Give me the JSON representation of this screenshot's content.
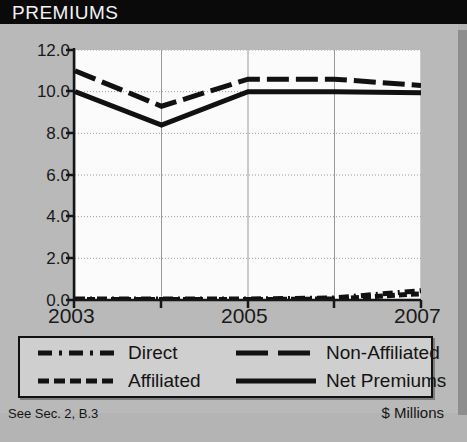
{
  "header": {
    "title": "PREMIUMS"
  },
  "footer": {
    "note": "See Sec. 2, B.3",
    "units": "$ Millions",
    "banner": "DIRECT PREMIUMS WRITTEN - YE 2007"
  },
  "colors": {
    "title_bar_bg": "#0a0a0a",
    "title_text": "#f2f2f2",
    "panel_bg": "#b9b9b9",
    "plot_bg": "#fbfbfb",
    "line": "#111111",
    "grid": "#9a9a9a",
    "legend_bg": "#cfcfcf"
  },
  "chart_data": {
    "type": "line",
    "title": "PREMIUMS",
    "xlabel": "",
    "ylabel": "$ Millions",
    "x": [
      2003,
      2004,
      2005,
      2006,
      2007
    ],
    "xticks": [
      "2003",
      "2005",
      "2007"
    ],
    "xtick_values": [
      2003,
      2005,
      2007
    ],
    "yticks": [
      "0.0",
      "2.0",
      "4.0",
      "6.0",
      "8.0",
      "10.0",
      "12.0"
    ],
    "ytick_values": [
      0.0,
      2.0,
      4.0,
      6.0,
      8.0,
      10.0,
      12.0
    ],
    "ylim": [
      0.0,
      12.0
    ],
    "xlim": [
      2003,
      2007
    ],
    "grid": true,
    "legend_position": "below",
    "series": [
      {
        "name": "Direct",
        "style": "dashdot",
        "values": [
          0.05,
          0.05,
          0.05,
          0.1,
          0.45
        ]
      },
      {
        "name": "Non-Affiliated",
        "style": "longdash",
        "values": [
          11.0,
          9.3,
          10.6,
          10.6,
          10.3
        ]
      },
      {
        "name": "Affiliated",
        "style": "shortdash",
        "values": [
          0.02,
          0.02,
          0.02,
          0.05,
          0.3
        ]
      },
      {
        "name": "Net Premiums",
        "style": "solid",
        "values": [
          10.0,
          8.4,
          10.0,
          10.0,
          9.95
        ]
      }
    ]
  },
  "legend": {
    "items": [
      {
        "label": "Direct",
        "key": "dashdot-line-key"
      },
      {
        "label": "Non-Affiliated",
        "key": "longdash-line-key"
      },
      {
        "label": "Affiliated",
        "key": "shortdash-line-key"
      },
      {
        "label": "Net Premiums",
        "key": "solid-line-key"
      }
    ]
  }
}
